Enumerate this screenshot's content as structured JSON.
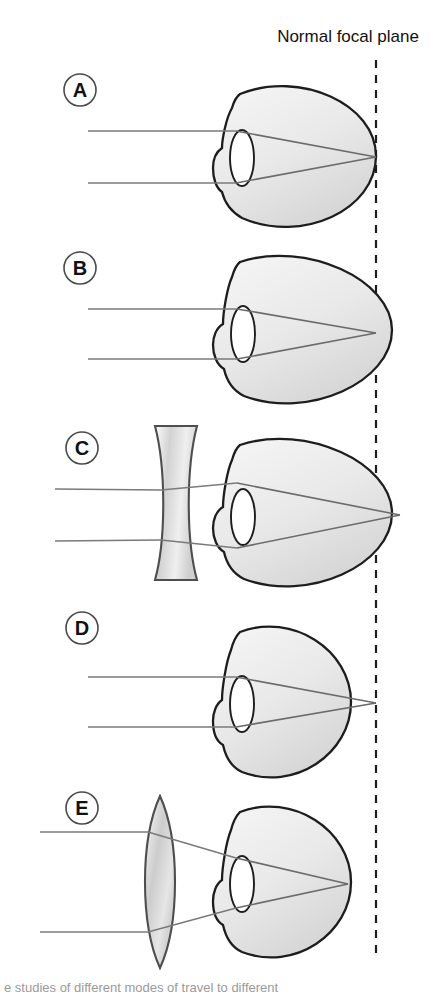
{
  "figure": {
    "title_label": "Normal focal plane",
    "bottom_caption": "e studies of different modes of travel to different",
    "colors": {
      "outline": "#1d1d1d",
      "sclera_fill_light": "#f3f3f3",
      "sclera_fill_dark": "#dcdcdc",
      "ray": "#6b6b6b",
      "lens_glass_light": "#f0f0f0",
      "lens_glass_dark": "#b9b9b9",
      "focal_plane": "#1d1d1d",
      "label_text": "#111111",
      "background": "#ffffff"
    },
    "focal_plane": {
      "x": 376,
      "y_top": 60,
      "y_bottom": 955,
      "style": "dashed",
      "label": "Normal focal plane"
    },
    "panels": [
      {
        "id": "A",
        "letter": "A",
        "label_name": "panel-label-a",
        "condition": "emmetropia",
        "eye_shape": "normal round eyeball",
        "corrective_lens": "none",
        "focus_point": "on retina at normal focal plane",
        "label_cx": 80,
        "label_cy": 90,
        "eye_cx": 296,
        "eye_cy": 155,
        "eye_rx": 80,
        "eye_ry": 77,
        "axis_y": 157,
        "ray_top_y": 131,
        "ray_bottom_y": 183,
        "ray_start_x": 88,
        "focus_x": 376
      },
      {
        "id": "B",
        "letter": "B",
        "label_name": "panel-label-b",
        "condition": "myopia",
        "eye_shape": "elongated eyeball",
        "corrective_lens": "none",
        "focus_point": "in front of retina at normal focal plane",
        "label_cx": 80,
        "label_cy": 268,
        "eye_cx": 300,
        "eye_cy": 330,
        "eye_rx": 92,
        "eye_ry": 79,
        "axis_y": 332,
        "ray_top_y": 309,
        "ray_bottom_y": 359,
        "ray_start_x": 88,
        "focus_x": 376
      },
      {
        "id": "C",
        "letter": "C",
        "label_name": "panel-label-c",
        "condition": "myopia corrected",
        "eye_shape": "elongated eyeball",
        "corrective_lens": "biconcave (diverging) lens",
        "focus_point": "on retina behind normal focal plane",
        "label_cx": 82,
        "label_cy": 448,
        "eye_cx": 300,
        "eye_cy": 513,
        "eye_rx": 92,
        "eye_ry": 79,
        "axis_y": 515,
        "ray_top_y": 489,
        "ray_bottom_y": 541,
        "ray_start_x": 55,
        "focus_x": 400,
        "lens": {
          "type": "concave",
          "x_center": 176,
          "y_top": 426,
          "y_bottom": 580,
          "half_width": 21
        }
      },
      {
        "id": "D",
        "letter": "D",
        "label_name": "panel-label-d",
        "condition": "hyperopia",
        "eye_shape": "shortened eyeball",
        "corrective_lens": "none",
        "focus_point": "behind retina at normal focal plane",
        "label_cx": 82,
        "label_cy": 628,
        "eye_cx": 283,
        "eye_cy": 700,
        "eye_rx": 68,
        "eye_ry": 78,
        "axis_y": 702,
        "ray_top_y": 677,
        "ray_bottom_y": 727,
        "ray_start_x": 88,
        "focus_x": 376
      },
      {
        "id": "E",
        "letter": "E",
        "label_name": "panel-label-e",
        "condition": "hyperopia corrected",
        "eye_shape": "shortened eyeball",
        "corrective_lens": "biconvex (converging) lens",
        "focus_point": "on retina in front of normal focal plane",
        "label_cx": 82,
        "label_cy": 808,
        "eye_cx": 283,
        "eye_cy": 880,
        "eye_rx": 68,
        "eye_ry": 78,
        "axis_y": 882,
        "ray_top_y": 832,
        "ray_bottom_y": 932,
        "ray_start_x": 40,
        "focus_x": 348,
        "lens": {
          "type": "convex",
          "x_center": 160,
          "y_top": 796,
          "y_bottom": 968,
          "half_width": 19
        }
      }
    ]
  }
}
